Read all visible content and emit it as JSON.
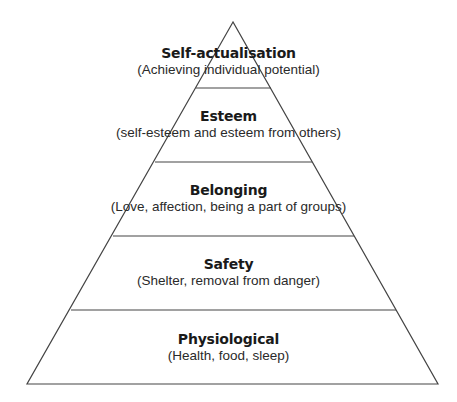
{
  "diagram": {
    "type": "pyramid",
    "line_color": "#444444",
    "background": "#ffffff",
    "levels": [
      {
        "title": "Self-actualisation",
        "description": "(Achieving individual potential)"
      },
      {
        "title": "Esteem",
        "description": "(self-esteem and esteem from others)"
      },
      {
        "title": "Belonging",
        "description": "(Love, affection, being a part of groups)"
      },
      {
        "title": "Safety",
        "description": "(Shelter, removal from danger)"
      },
      {
        "title": "Physiological",
        "description": "(Health, food, sleep)"
      }
    ]
  }
}
